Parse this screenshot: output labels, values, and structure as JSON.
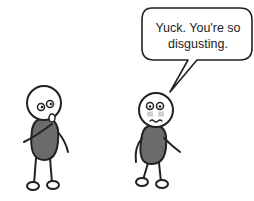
{
  "comic": {
    "speech_bubble": {
      "line1": "Yuck. You're so",
      "line2": "disgusting."
    },
    "characters": [
      {
        "name": "left-stick-figure",
        "pose": "finger-in-mouth",
        "body_color": "#6b6b6b"
      },
      {
        "name": "right-stick-figure",
        "pose": "disgusted",
        "body_color": "#6b6b6b"
      }
    ]
  }
}
